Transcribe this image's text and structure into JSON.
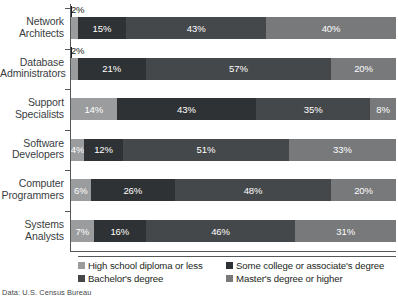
{
  "source_note": "Data: U.S. Census Bureau",
  "legend": {
    "items": [
      {
        "label": "High school diploma or less",
        "color": "#9a9c9e",
        "key": "c0"
      },
      {
        "label": "Some college or associate's degree",
        "color": "#2f3234",
        "key": "c1"
      },
      {
        "label": "Bachelor's degree",
        "color": "#45484a",
        "key": "c2"
      },
      {
        "label": "Master's degree or higher",
        "color": "#77797b",
        "key": "c3"
      }
    ]
  },
  "chart_data": {
    "type": "bar",
    "orientation": "horizontal",
    "stacked": true,
    "stack_total": 100,
    "title": "",
    "xlabel": "",
    "ylabel": "",
    "xlim": [
      0,
      100
    ],
    "grid": false,
    "legend_position": "bottom",
    "value_suffix": "%",
    "categories": [
      "Network Architects",
      "Database Administrators",
      "Support Specialists",
      "Software Developers",
      "Computer Programmers",
      "Systems Analysts"
    ],
    "series": [
      {
        "name": "High school diploma or less",
        "color": "#9a9c9e",
        "values": [
          2,
          2,
          14,
          4,
          6,
          7
        ]
      },
      {
        "name": "Some college or associate's degree",
        "color": "#2f3234",
        "values": [
          15,
          21,
          43,
          12,
          26,
          16
        ]
      },
      {
        "name": "Bachelor's degree",
        "color": "#45484a",
        "values": [
          43,
          57,
          35,
          51,
          48,
          46
        ]
      },
      {
        "name": "Master's degree or higher",
        "color": "#77797b",
        "values": [
          40,
          20,
          8,
          33,
          20,
          31
        ]
      }
    ],
    "rows": [
      {
        "category": "Network Architects",
        "label_lines": [
          "Network",
          "Architects"
        ],
        "segments": [
          {
            "value": 2,
            "label": "2%",
            "key": "c0",
            "outside": true
          },
          {
            "value": 15,
            "label": "15%",
            "key": "c1",
            "outside": false
          },
          {
            "value": 43,
            "label": "43%",
            "key": "c2",
            "outside": false
          },
          {
            "value": 40,
            "label": "40%",
            "key": "c3",
            "outside": false
          }
        ]
      },
      {
        "category": "Database Administrators",
        "label_lines": [
          "Database",
          "Administrators"
        ],
        "segments": [
          {
            "value": 2,
            "label": "2%",
            "key": "c0",
            "outside": true
          },
          {
            "value": 21,
            "label": "21%",
            "key": "c1",
            "outside": false
          },
          {
            "value": 57,
            "label": "57%",
            "key": "c2",
            "outside": false
          },
          {
            "value": 20,
            "label": "20%",
            "key": "c3",
            "outside": false
          }
        ]
      },
      {
        "category": "Support Specialists",
        "label_lines": [
          "Support",
          "Specialists"
        ],
        "segments": [
          {
            "value": 14,
            "label": "14%",
            "key": "c0",
            "outside": false
          },
          {
            "value": 43,
            "label": "43%",
            "key": "c1",
            "outside": false
          },
          {
            "value": 35,
            "label": "35%",
            "key": "c2",
            "outside": false
          },
          {
            "value": 8,
            "label": "8%",
            "key": "c3",
            "outside": false
          }
        ]
      },
      {
        "category": "Software Developers",
        "label_lines": [
          "Software",
          "Developers"
        ],
        "segments": [
          {
            "value": 4,
            "label": "4%",
            "key": "c0",
            "outside": false
          },
          {
            "value": 12,
            "label": "12%",
            "key": "c1",
            "outside": false
          },
          {
            "value": 51,
            "label": "51%",
            "key": "c2",
            "outside": false
          },
          {
            "value": 33,
            "label": "33%",
            "key": "c3",
            "outside": false
          }
        ]
      },
      {
        "category": "Computer Programmers",
        "label_lines": [
          "Computer",
          "Programmers"
        ],
        "segments": [
          {
            "value": 6,
            "label": "6%",
            "key": "c0",
            "outside": false
          },
          {
            "value": 26,
            "label": "26%",
            "key": "c1",
            "outside": false
          },
          {
            "value": 48,
            "label": "48%",
            "key": "c2",
            "outside": false
          },
          {
            "value": 20,
            "label": "20%",
            "key": "c3",
            "outside": false
          }
        ]
      },
      {
        "category": "Systems Analysts",
        "label_lines": [
          "Systems",
          "Analysts"
        ],
        "segments": [
          {
            "value": 7,
            "label": "7%",
            "key": "c0",
            "outside": false
          },
          {
            "value": 16,
            "label": "16%",
            "key": "c1",
            "outside": false
          },
          {
            "value": 46,
            "label": "46%",
            "key": "c2",
            "outside": false
          },
          {
            "value": 31,
            "label": "31%",
            "key": "c3",
            "outside": false
          }
        ]
      }
    ]
  }
}
